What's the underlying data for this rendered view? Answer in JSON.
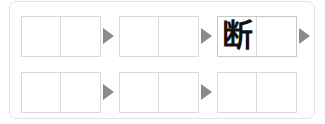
{
  "panel": {
    "name": "kanji-writing-practice-grid",
    "border_color": "#e2e2e2",
    "background": "#ffffff"
  },
  "style": {
    "cell_border_color": "#d9d9d9",
    "arrow_color": "#8a8a8a",
    "glyph_color": "#111111"
  },
  "rows": [
    {
      "index": 0,
      "boxes": [
        {
          "left_cell": "",
          "right_cell": "",
          "emphasis": false,
          "x": 11
        },
        {
          "left_cell": "",
          "right_cell": "",
          "emphasis": false,
          "x": 109
        },
        {
          "left_cell": "断",
          "right_cell": "",
          "emphasis": true,
          "x": 207
        }
      ],
      "arrows": [
        {
          "x": 93
        },
        {
          "x": 191
        },
        {
          "x": 289
        }
      ]
    },
    {
      "index": 1,
      "boxes": [
        {
          "left_cell": "",
          "right_cell": "",
          "emphasis": false,
          "x": 11
        },
        {
          "left_cell": "",
          "right_cell": "",
          "emphasis": false,
          "x": 109
        },
        {
          "left_cell": "",
          "right_cell": "",
          "emphasis": false,
          "x": 207
        }
      ],
      "arrows": [
        {
          "x": 93
        },
        {
          "x": 191
        }
      ]
    }
  ]
}
